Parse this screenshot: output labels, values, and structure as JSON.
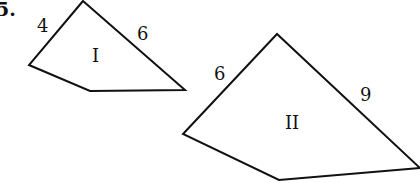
{
  "problem_number": "5.",
  "figures": [
    {
      "id": "I",
      "label": "I",
      "vertices": [
        [
          83,
          1
        ],
        [
          29,
          65
        ],
        [
          90,
          91
        ],
        [
          185,
          90
        ]
      ],
      "side_labels": [
        {
          "text": "4",
          "x": 44,
          "y": 32
        },
        {
          "text": "6",
          "x": 143,
          "y": 40
        }
      ],
      "label_pos": {
        "x": 97,
        "y": 62
      }
    },
    {
      "id": "II",
      "label": "II",
      "vertices": [
        [
          277,
          34
        ],
        [
          183,
          134
        ],
        [
          279,
          180
        ],
        [
          420,
          168
        ]
      ],
      "side_labels": [
        {
          "text": "6",
          "x": 220,
          "y": 80
        },
        {
          "text": "9",
          "x": 366,
          "y": 101
        }
      ],
      "label_pos": {
        "x": 294,
        "y": 129
      }
    }
  ]
}
